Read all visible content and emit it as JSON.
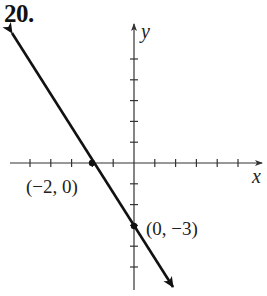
{
  "problem_number": "20.",
  "chart_data": {
    "type": "line",
    "title": "",
    "xlabel": "x",
    "ylabel": "y",
    "xlim": [
      -5,
      5
    ],
    "ylim": [
      -5,
      5
    ],
    "grid": false,
    "tick_step": 1,
    "series": [
      {
        "name": "line",
        "equation": "y = -1.5x - 3",
        "slope": -1.5,
        "intercept": -3,
        "x": [
          -2,
          0
        ],
        "y": [
          0,
          -3
        ],
        "arrows_both_ends": true
      }
    ],
    "points": [
      {
        "x": -2,
        "y": 0,
        "label": "(−2, 0)"
      },
      {
        "x": 0,
        "y": -3,
        "label": "(0, −3)"
      }
    ],
    "annotations": [
      "(−2, 0)",
      "(0, −3)"
    ]
  },
  "labels": {
    "x_axis": "x",
    "y_axis": "y",
    "point_a": "(−2, 0)",
    "point_b": "(0, −3)"
  },
  "colors": {
    "line": "#111111",
    "axis": "#333333"
  }
}
